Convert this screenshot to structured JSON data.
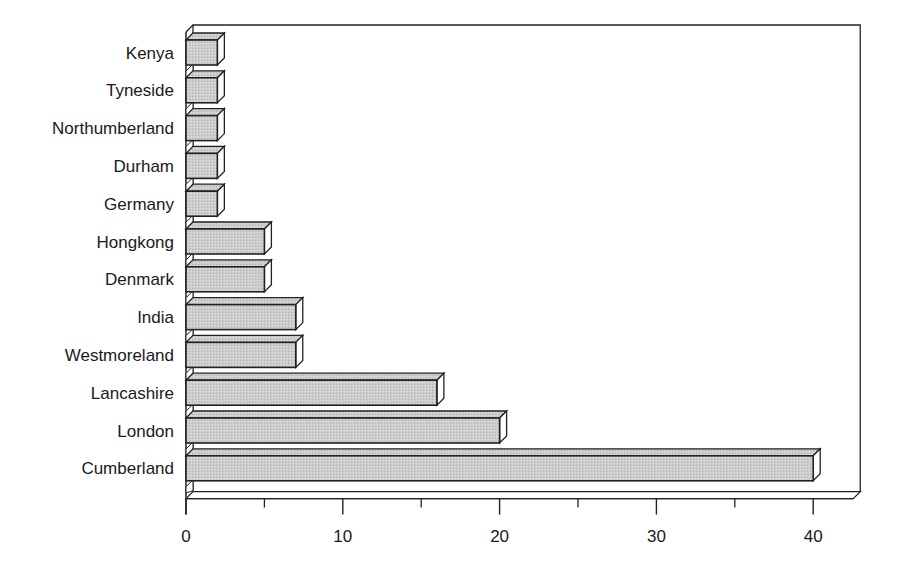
{
  "chart_data": {
    "type": "bar",
    "orientation": "horizontal",
    "style": "3d",
    "title": "",
    "xlabel": "",
    "ylabel": "",
    "categories": [
      "Kenya",
      "Tyneside",
      "Northumberland",
      "Durham",
      "Germany",
      "Hongkong",
      "Denmark",
      "India",
      "Westmoreland",
      "Lancashire",
      "London",
      "Cumberland"
    ],
    "values": [
      2,
      2,
      2,
      2,
      2,
      5,
      5,
      7,
      7,
      16,
      20,
      40
    ],
    "xlim": [
      0,
      40
    ],
    "xticks": [
      0,
      10,
      20,
      30,
      40
    ],
    "minor_ticks": [
      5,
      15,
      25,
      35
    ],
    "grid": false,
    "legend": null,
    "colors": {
      "bar_face": "#c8c8c8",
      "bar_top": "#b4b4b4",
      "bar_side": "#ffffff",
      "outline": "#222222"
    }
  }
}
